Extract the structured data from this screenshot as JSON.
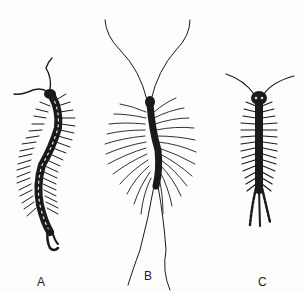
{
  "figure": {
    "background": "#fdfdfd",
    "ink_color": "#1a1a1a",
    "specimens": [
      {
        "id": "A",
        "label": "A"
      },
      {
        "id": "B",
        "label": "B"
      },
      {
        "id": "C",
        "label": "C"
      }
    ]
  }
}
